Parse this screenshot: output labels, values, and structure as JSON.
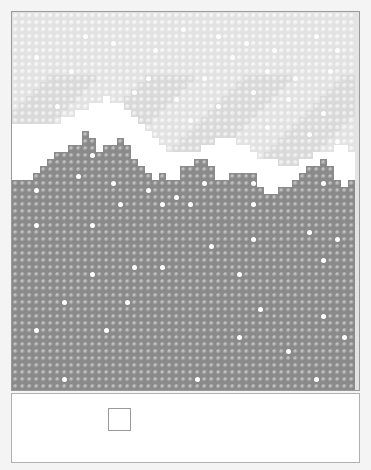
{
  "scene": {
    "title": "",
    "grid": {
      "cols": 49,
      "rows": 54,
      "cell_px": 7
    },
    "colors": {
      "sky": "#e2e2e2",
      "snow_cap": "#ffffff",
      "rock": "#8a8a8a",
      "snowflake": "#ffffff",
      "border": "#9a9a9a"
    },
    "white_mountain_top": [
      16,
      16,
      16,
      16,
      16,
      16,
      16,
      15,
      15,
      14,
      14,
      13,
      13,
      12,
      13,
      13,
      14,
      15,
      16,
      17,
      18,
      19,
      20,
      20,
      20,
      20,
      20,
      19,
      19,
      18,
      18,
      18,
      19,
      19,
      20,
      21,
      21,
      21,
      22,
      22,
      22,
      21,
      21,
      20,
      20,
      20,
      19,
      19,
      20
    ],
    "rock_top": [
      24,
      24,
      24,
      23,
      22,
      21,
      20,
      20,
      19,
      19,
      17,
      18,
      20,
      19,
      19,
      18,
      19,
      21,
      22,
      23,
      24,
      23,
      24,
      24,
      22,
      22,
      21,
      21,
      22,
      24,
      24,
      23,
      23,
      23,
      23,
      25,
      26,
      26,
      25,
      25,
      24,
      23,
      22,
      22,
      21,
      22,
      24,
      25,
      24
    ],
    "rock_snowflakes": [
      [
        15,
        27
      ],
      [
        21,
        27
      ],
      [
        25,
        27
      ],
      [
        34,
        27
      ],
      [
        3,
        30
      ],
      [
        11,
        30
      ],
      [
        42,
        31
      ],
      [
        34,
        32
      ],
      [
        46,
        32
      ],
      [
        28,
        33
      ],
      [
        44,
        35
      ],
      [
        17,
        36
      ],
      [
        21,
        36
      ],
      [
        11,
        37
      ],
      [
        32,
        37
      ],
      [
        7,
        41
      ],
      [
        16,
        41
      ],
      [
        35,
        42
      ],
      [
        44,
        43
      ],
      [
        3,
        45
      ],
      [
        13,
        45
      ],
      [
        32,
        46
      ],
      [
        47,
        46
      ],
      [
        39,
        48
      ],
      [
        7,
        52
      ],
      [
        26,
        52
      ],
      [
        43,
        52
      ],
      [
        3,
        25
      ],
      [
        9,
        23
      ],
      [
        11,
        20
      ],
      [
        14,
        24
      ],
      [
        19,
        25
      ],
      [
        27,
        24
      ],
      [
        34,
        24
      ],
      [
        44,
        24
      ],
      [
        23,
        26
      ]
    ],
    "sky_snowflakes": [
      [
        10,
        3
      ],
      [
        14,
        4
      ],
      [
        20,
        5
      ],
      [
        24,
        2
      ],
      [
        29,
        3
      ],
      [
        33,
        4
      ],
      [
        37,
        5
      ],
      [
        43,
        3
      ],
      [
        46,
        5
      ],
      [
        3,
        6
      ],
      [
        8,
        8
      ],
      [
        19,
        9
      ],
      [
        27,
        9
      ],
      [
        31,
        6
      ],
      [
        36,
        8
      ],
      [
        40,
        9
      ],
      [
        45,
        8
      ],
      [
        6,
        13
      ],
      [
        17,
        11
      ],
      [
        23,
        12
      ],
      [
        29,
        13
      ],
      [
        34,
        11
      ],
      [
        39,
        12
      ],
      [
        44,
        14
      ],
      [
        2,
        16
      ],
      [
        11,
        15
      ],
      [
        25,
        15
      ],
      [
        36,
        16
      ],
      [
        42,
        17
      ],
      [
        46,
        18
      ]
    ]
  },
  "panel": {
    "slot_label": ""
  }
}
